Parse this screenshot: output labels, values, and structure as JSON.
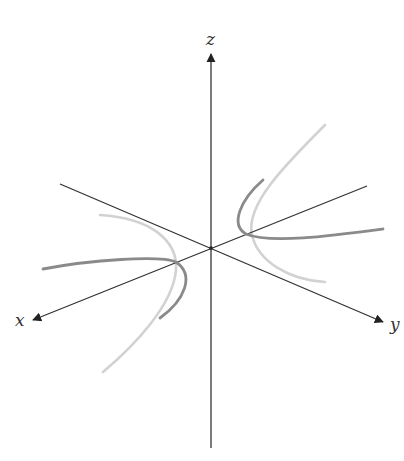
{
  "diagram": {
    "axes": {
      "x": {
        "label": "x"
      },
      "y": {
        "label": "y"
      },
      "z": {
        "label": "z"
      }
    },
    "colors": {
      "axis": "#333333",
      "dark_curve": "#8a8a8a",
      "light_curve": "#d2d2d2",
      "background": "#ffffff"
    }
  }
}
